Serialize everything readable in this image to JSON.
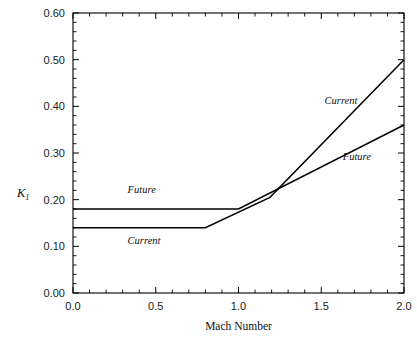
{
  "chart_data": {
    "type": "line",
    "title": "",
    "xlabel": "Mach Number",
    "ylabel": "K",
    "ylabel_subscript": "1",
    "xlim": [
      0.0,
      2.0
    ],
    "ylim": [
      0.0,
      0.6
    ],
    "xticks": [
      0.0,
      0.5,
      1.0,
      1.5,
      2.0
    ],
    "xtick_labels": [
      "0.0",
      "0.5",
      "1.0",
      "1.5",
      "2.0"
    ],
    "yticks": [
      0.0,
      0.1,
      0.2,
      0.3,
      0.4,
      0.5,
      0.6
    ],
    "ytick_labels": [
      "0.00",
      "0.10",
      "0.20",
      "0.30",
      "0.40",
      "0.50",
      "0.60"
    ],
    "x_minor_tick_step": 0.1,
    "y_minor_tick_step": 0.02,
    "grid": false,
    "legend": "inline-annotations",
    "series": [
      {
        "name": "Current",
        "x": [
          0.0,
          0.8,
          1.19,
          2.0
        ],
        "y": [
          0.14,
          0.14,
          0.205,
          0.5
        ]
      },
      {
        "name": "Future",
        "x": [
          0.0,
          1.0,
          2.0
        ],
        "y": [
          0.18,
          0.18,
          0.36
        ]
      }
    ],
    "annotations": [
      {
        "text": "Future",
        "x": 0.33,
        "y": 0.215,
        "series": "Future"
      },
      {
        "text": "Current",
        "x": 0.33,
        "y": 0.105,
        "series": "Current"
      },
      {
        "text": "Current",
        "x": 1.52,
        "y": 0.405,
        "series": "Current"
      },
      {
        "text": "Future",
        "x": 1.63,
        "y": 0.285,
        "series": "Future"
      }
    ],
    "colors": {
      "line": "#000000",
      "axis": "#000000",
      "text": "#111111",
      "background": "#ffffff"
    }
  },
  "figure": {
    "plot_left_px": 73,
    "plot_right_px": 404,
    "plot_top_px": 13,
    "plot_bottom_px": 293
  }
}
